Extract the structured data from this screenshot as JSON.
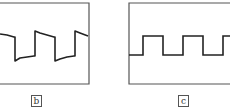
{
  "panels": [
    {
      "id": "b",
      "label": "b",
      "description": "Square wave with tilted (drooping) tops and bottoms",
      "frame": {
        "x1": 0,
        "y1": 3,
        "x2": 89,
        "y2": 84
      },
      "waveform_points": "0,34 7,35 14,37 15,37 15,61 20,58 27,57 34,56 35,56 35,31 40,33 47,35 54,37 55,37 55,61 60,59 67,57 74,56 75,56 75,31 80,33 88,36"
    },
    {
      "id": "c",
      "label": "c",
      "description": "Ideal square wave",
      "frame": {
        "x1": 129,
        "y1": 3,
        "x2": 232,
        "y2": 84
      },
      "waveform_points": "129,55 143,55 143,36 163,36 163,55 183,55 183,36 203,36 203,55 223,55 223,36 232,36"
    }
  ],
  "colors": {
    "frame": "#555555",
    "trace": "#222222",
    "background": "#ffffff"
  }
}
